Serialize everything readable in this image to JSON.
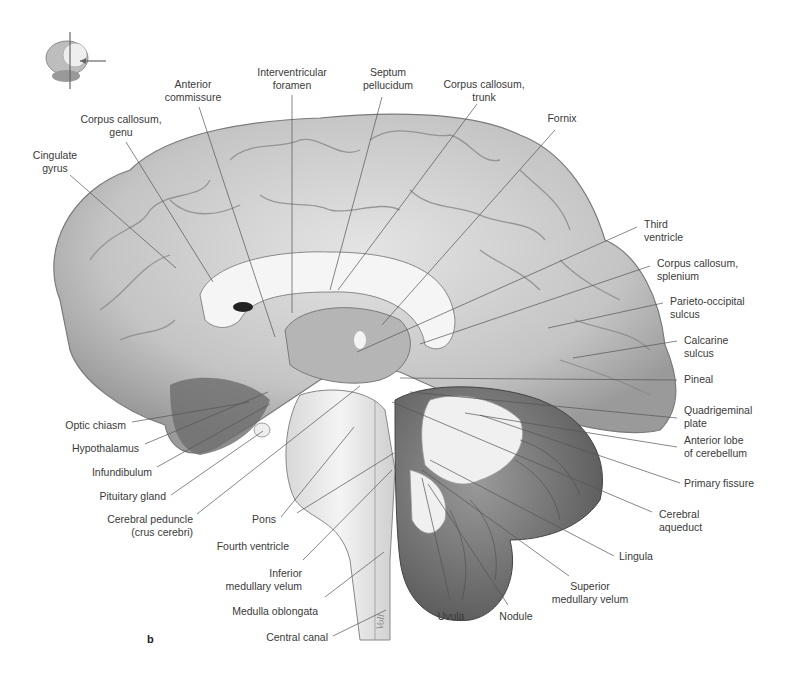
{
  "figure": {
    "panel_letter": "b",
    "signature": "Voll",
    "orientation_icon": "brain-orientation-icon"
  },
  "labels": {
    "anterior_commissure": [
      "Anterior",
      "commissure"
    ],
    "interventricular_foramen": [
      "Interventricular",
      "foramen"
    ],
    "septum_pellucidum": [
      "Septum",
      "pellucidum"
    ],
    "corpus_callosum_trunk": [
      "Corpus callosum,",
      "trunk"
    ],
    "fornix": [
      "Fornix"
    ],
    "corpus_callosum_genu": [
      "Corpus callosum,",
      "genu"
    ],
    "cingulate_gyrus": [
      "Cingulate",
      "gyrus"
    ],
    "third_ventricle": [
      "Third",
      "ventricle"
    ],
    "corpus_callosum_splenium": [
      "Corpus callosum,",
      "splenium"
    ],
    "parieto_occipital_sulcus": [
      "Parieto-occipital",
      "sulcus"
    ],
    "calcarine_sulcus": [
      "Calcarine",
      "sulcus"
    ],
    "pineal": [
      "Pineal"
    ],
    "quadrigeminal_plate": [
      "Quadrigeminal",
      "plate"
    ],
    "anterior_lobe_cerebellum": [
      "Anterior lobe",
      "of cerebellum"
    ],
    "primary_fissure": [
      "Primary fissure"
    ],
    "cerebral_aqueduct": [
      "Cerebral",
      "aqueduct"
    ],
    "lingula": [
      "Lingula"
    ],
    "superior_medullary_velum": [
      "Superior",
      "medullary velum"
    ],
    "nodule": [
      "Nodule"
    ],
    "uvula": [
      "Uvula"
    ],
    "central_canal": [
      "Central canal"
    ],
    "medulla_oblongata": [
      "Medulla oblongata"
    ],
    "inferior_medullary_velum": [
      "Inferior",
      "medullary velum"
    ],
    "fourth_ventricle": [
      "Fourth ventricle"
    ],
    "pons": [
      "Pons"
    ],
    "cerebral_peduncle": [
      "Cerebral peduncle",
      "(crus cerebri)"
    ],
    "pituitary_gland": [
      "Pituitary gland"
    ],
    "infundibulum": [
      "Infundibulum"
    ],
    "hypothalamus": [
      "Hypothalamus"
    ],
    "optic_chiasm": [
      "Optic chiasm"
    ]
  },
  "colors": {
    "cortex": "#cfcfcf",
    "cortex_shadow": "#8a8a8a",
    "white_matter": "#f2f2f2",
    "cerebellum_dark": "#6e6e6e",
    "leader_line": "#555555",
    "text": "#3a3a3a"
  }
}
